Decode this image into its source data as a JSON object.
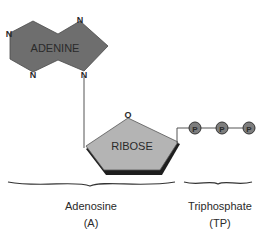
{
  "diagram": {
    "adenine": {
      "label": "ADENINE",
      "atoms": [
        "N",
        "N",
        "N",
        "N"
      ],
      "fill": "#6e6e6e"
    },
    "ribose": {
      "label": "RIBOSE",
      "oxygen": "O",
      "fill": "#b4b4b4",
      "shadow": "#1e1e1e"
    },
    "phosphates": {
      "labels": [
        "P",
        "P",
        "P"
      ],
      "fill": "#7d7d7d"
    },
    "groups": {
      "adenosine": {
        "name": "Adenosine",
        "abbr": "(A)"
      },
      "triphosphate": {
        "name": "Triphosphate",
        "abbr": "(TP)"
      }
    }
  }
}
